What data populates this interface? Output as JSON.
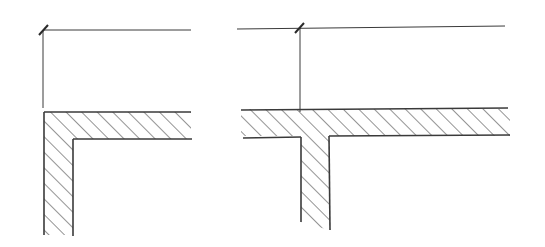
{
  "diagram": {
    "colors": {
      "line": "#3a3a3a",
      "background": "#ffffff"
    },
    "figures": [
      {
        "id": "left",
        "label": "",
        "dimension_line": {
          "x1": 44,
          "y1": 30,
          "x2": 191,
          "y2": 30
        },
        "extension_line": {
          "x1": 43,
          "y1": 30,
          "x2": 43,
          "y2": 108
        },
        "tick": {
          "x": 43,
          "y": 30
        },
        "slab": {
          "x_left": 44,
          "x_right": 191,
          "y_top": 112,
          "y_bottom": 139
        },
        "wall": {
          "x_outer": 44,
          "x_inner": 73,
          "y_bottom": 235
        }
      },
      {
        "id": "right",
        "label": "",
        "dimension_line": {
          "x1": 237,
          "y1": 29,
          "x2": 505,
          "y2": 26
        },
        "extension_line": {
          "x1": 300,
          "y1": 28,
          "x2": 300,
          "y2": 112
        },
        "tick": {
          "x": 300,
          "y": 28
        },
        "slab": {
          "x_left": 241,
          "x_right": 510,
          "y_top": 109,
          "y_bottom": 136
        },
        "wall": {
          "x_left": 301,
          "x_right": 329,
          "y_bottom_left": 222,
          "y_bottom_right": 230
        }
      }
    ]
  }
}
